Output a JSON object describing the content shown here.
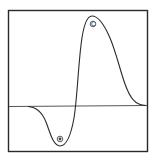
{
  "diagram": {
    "type": "biphasic-waveform",
    "colors": {
      "frame": "#2a2a2a",
      "curve": "#2a2a2a",
      "baseline": "#555555",
      "background": "#ffffff"
    },
    "markers": [
      {
        "id": "upper-peak",
        "label": "C"
      },
      {
        "id": "lower-trough",
        "label": "B"
      }
    ]
  }
}
